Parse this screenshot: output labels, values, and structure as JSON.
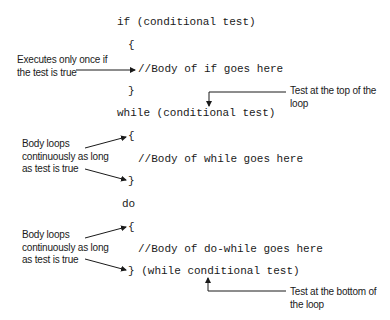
{
  "code": {
    "if_header": "if (conditional test)",
    "if_open": "{",
    "if_body": "//Body of if goes here",
    "if_close": "}",
    "while_header": "while (conditional test)",
    "while_open": "{",
    "while_body": "//Body of while goes here",
    "while_close": "}",
    "do_keyword": "do",
    "do_open": "{",
    "do_body": "//Body of do-while goes here",
    "do_close": "} (while conditional test)"
  },
  "annotations": {
    "if_note": "Executes only once if\nthe test is true",
    "top_test_note": "Test at the top of the\nloop",
    "while_note": "Body loops\ncontinuously as long\nas test is true",
    "do_note": "Body loops\ncontinuously as long\nas test is true",
    "bottom_test_note": "Test at the bottom of\nthe loop"
  },
  "colors": {
    "text": "#1a1a1a",
    "background": "#ffffff"
  }
}
